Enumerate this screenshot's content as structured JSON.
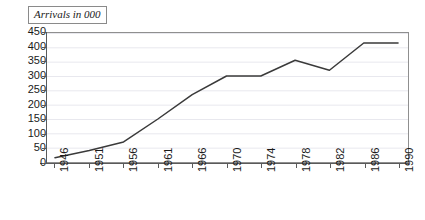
{
  "chart_data": {
    "type": "line",
    "title": "Arrivals in 000",
    "xlabel": "",
    "ylabel": "",
    "categories": [
      "1946",
      "1951",
      "1956",
      "1961",
      "1966",
      "1970",
      "1974",
      "1978",
      "1982",
      "1986",
      "1990"
    ],
    "x": [
      1946,
      1951,
      1956,
      1961,
      1966,
      1970,
      1974,
      1978,
      1982,
      1986,
      1990
    ],
    "values": [
      15,
      40,
      70,
      150,
      235,
      300,
      300,
      355,
      320,
      415,
      415
    ],
    "series": [
      {
        "name": "Arrivals",
        "values": [
          15,
          40,
          70,
          150,
          235,
          300,
          300,
          355,
          320,
          415,
          415
        ]
      }
    ],
    "ylim": [
      0,
      450
    ],
    "yticks": [
      0,
      50,
      100,
      150,
      200,
      250,
      300,
      350,
      400,
      450
    ],
    "ytick_labels": [
      "0",
      "50",
      "100",
      "150",
      "200",
      "250",
      "300",
      "350",
      "400",
      "450"
    ],
    "xlim": [
      1946,
      1990
    ],
    "grid": true,
    "grid_axis": "y",
    "legend": false,
    "line_color": "#3a3a3a",
    "grid_color": "#e8e8ee",
    "axis_color": "#5a5a5a",
    "frame_color": "#8f8f8f",
    "background_color": "#ffffff",
    "text_color": "#1a1a1a"
  }
}
